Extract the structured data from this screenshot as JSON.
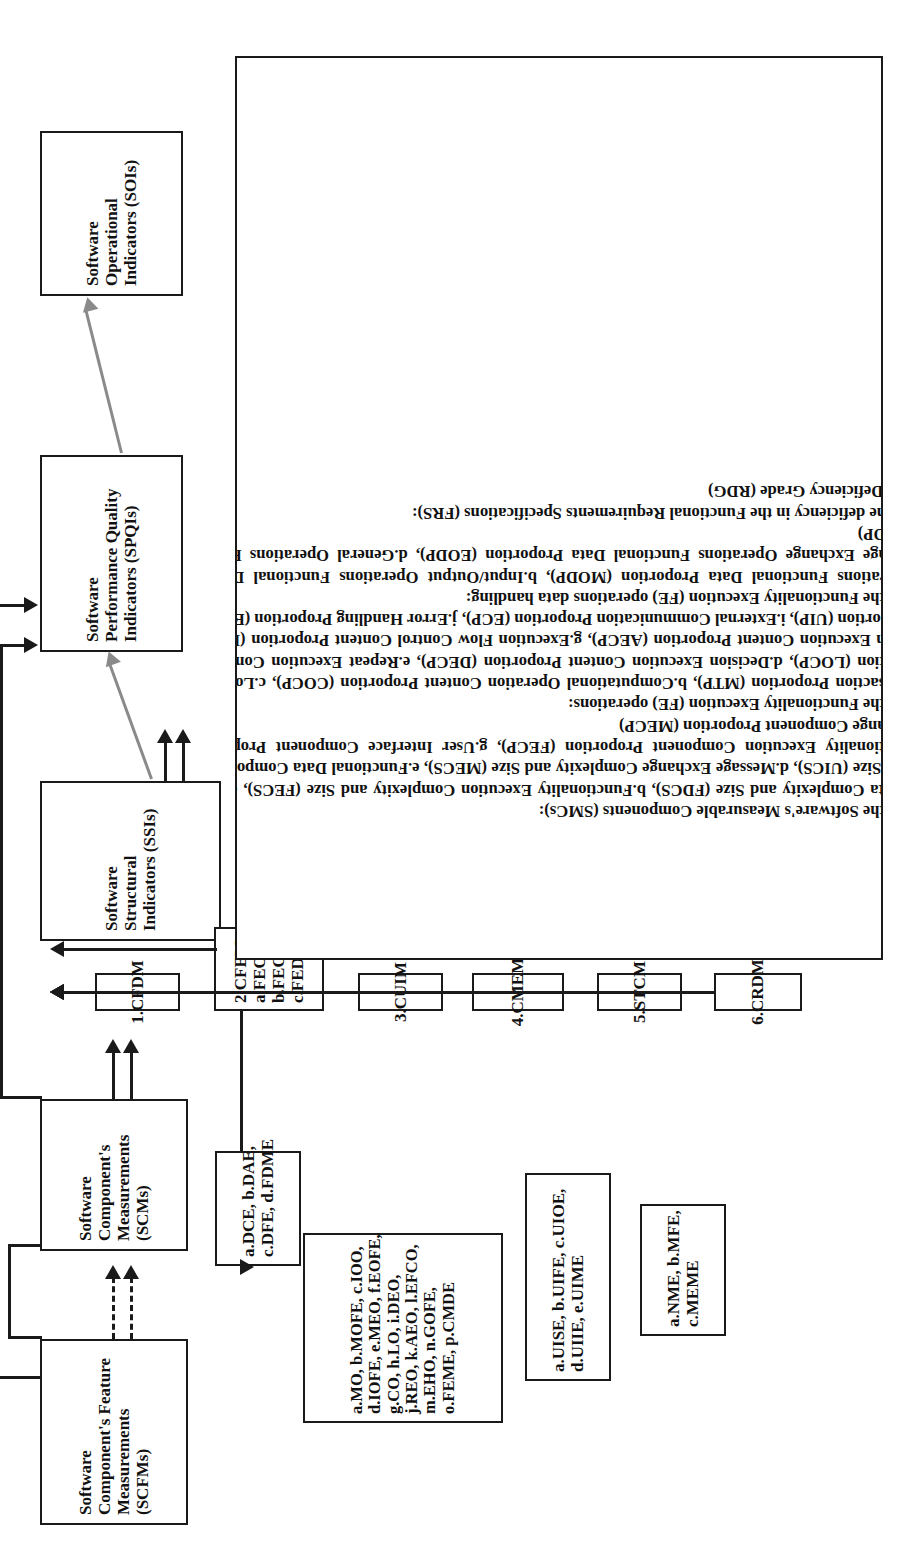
{
  "diagram": {
    "stages": [
      {
        "id": "scfms",
        "lines": [
          "Software",
          "Component's Feature",
          "Measurements",
          "(SCFMs)"
        ]
      },
      {
        "id": "scms",
        "lines": [
          "Software",
          "Component's",
          "Measurements",
          "(SCMs)"
        ]
      },
      {
        "id": "ssis",
        "lines": [
          "Software",
          "Structural",
          "Indicators (SSIs)"
        ]
      },
      {
        "id": "spqis",
        "lines": [
          "Software",
          "Performance   Quality",
          "Indicators (SPQIs)"
        ]
      },
      {
        "id": "sois",
        "lines": [
          "Software",
          "Operational",
          "Indicators (SOIs)"
        ]
      }
    ],
    "methods": [
      {
        "id": "cfdm",
        "lines": [
          "1.CFDM"
        ]
      },
      {
        "id": "cfem",
        "lines": [
          "2.CFEM:",
          "a.FEODM",
          "b.FEOM",
          "c.FEDM"
        ]
      },
      {
        "id": "cuim",
        "lines": [
          "3.CUIM"
        ]
      },
      {
        "id": "cmem",
        "lines": [
          "4.CMEM"
        ]
      },
      {
        "id": "stcm",
        "lines": [
          "5.STCM"
        ]
      },
      {
        "id": "crdm",
        "lines": [
          "6.CRDM"
        ]
      }
    ],
    "abbreviation_boxes": [
      {
        "id": "cfdm-abbr",
        "lines": [
          "a.DCE,  b.DAE,",
          "c.DFE, d.FDME"
        ]
      },
      {
        "id": "cfem-abbr",
        "lines": [
          "a.MO,  b.MOFE,  c.IOO,",
          "d.IOFE, e.MEO, f.EOFE,",
          "g.CO,    h.LO,    i.DEO,",
          "j.REO, k.AEO,  l.EFCO,",
          "m.EHO,           n.GOFE,",
          "o.FEME, p.CMDE"
        ]
      },
      {
        "id": "cuim-abbr",
        "lines": [
          "a.UISE, b.UIFE, c.UIOE,",
          "d.UIIE, e.UIME"
        ]
      },
      {
        "id": "cmem-abbr",
        "lines": [
          "a.NME,  b.MFE,",
          "c.MEME"
        ]
      }
    ],
    "indicator_panel": {
      "sections": [
        {
          "id": "section-1",
          "heading": "1.SSIs denoting the Software's Measurable Components (SMCs):",
          "body": "a.Functional Data Complexity and Size (FDCS), b.Functionality Execution Complexity and Size (FECS), c.User Interface Complexity and Size (UICS), d.Message Exchange Complexity and Size (MECS), e.Functional Data Component Proportion (FDCP), f.Functionality Execution Component Proportion (FECP), g.User Interface Component Proportion (UICP), h.Message Exchange Component Proportion (MECP)"
        },
        {
          "id": "section-2",
          "heading": "2.SSIs denoting the Functionality Execution (FE) operations:",
          "body": "a.Memory Transaction Proportion (MTP), b.Computational Operation Content Proportion (COCP), c.Logical Operation Content Proportion (LOCP), d.Decision Execution Content Proportion (DECP), e.Repeat Execution Content Proportion (RECP), f.Action Execution Content Proportion (AECP), g.Execution Flow Control Content Proportion (EFCCP), h.User Interaction Proportion (UIP), i.External Communication Proportion (ECP), j.Error Handling Proportion (EHP)"
        },
        {
          "id": "section-3",
          "heading": "3.SSIs denoting the Functionality Execution (FE) operations data handling:",
          "body": "a.Memory Operations Functional Data Proportion (MODP), b.Input/Output Operations Functional Data Proportion (IODP), c.Message Exchange Operations Functional Data Proportion (EODP), d.General Operations Functional Data Proportion (GODP)"
        },
        {
          "id": "section-4",
          "heading": "4.SSI denoting the deficiency in the Functional Requirements Specifications (FRS):",
          "body": "a.Requirements Deficiency Grade (RDG)"
        }
      ]
    },
    "colors": {
      "ink": "#1a1a1a",
      "gray_arrow": "#8a8a8a",
      "background": "#ffffff"
    }
  }
}
